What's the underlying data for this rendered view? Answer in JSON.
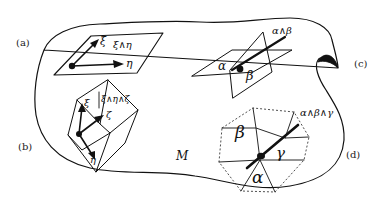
{
  "figure": {
    "manifold_label": "M",
    "panels": [
      {
        "id": "a",
        "label": "(a)",
        "description": "planar parallelogram spanned by two vectors",
        "vectors": [
          "ξ",
          "η"
        ],
        "wedge_label": "ξ∧η"
      },
      {
        "id": "b",
        "label": "(b)",
        "description": "parallelepiped spanned by three vectors",
        "vectors": [
          "ξ",
          "ζ",
          "η"
        ],
        "wedge_label": "ξ∧η∧ζ"
      },
      {
        "id": "c",
        "label": "(c)",
        "description": "two intersecting planes (1-forms) with line of intersection",
        "forms": [
          "α",
          "β"
        ],
        "wedge_label": "α∧β"
      },
      {
        "id": "d",
        "label": "(d)",
        "description": "three intersecting planes forming a cell with a point",
        "forms": [
          "β",
          "γ",
          "α"
        ],
        "wedge_label": "α∧β∧γ"
      }
    ]
  }
}
